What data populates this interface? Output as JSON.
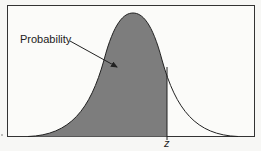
{
  "diagram": {
    "type": "normal-distribution-cdf",
    "annotation_label": "Probability",
    "z_label": "z",
    "colors": {
      "fill": "#7d7d7d",
      "curve": "#222222",
      "frame": "#333333",
      "background": "#f7f7f5"
    }
  }
}
